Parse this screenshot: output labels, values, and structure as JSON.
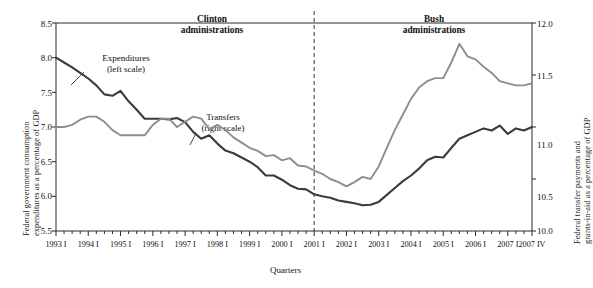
{
  "chart_data": {
    "type": "line",
    "title": "",
    "xlabel": "Quarters",
    "ylabel": "Federal government consumption expenditures as a percentage of GDP",
    "ylabel_right": "Federal transfer payments and grants-in-aid as a percentage of GDP",
    "ylim": [
      5.5,
      8.5
    ],
    "ylim_right": [
      10.0,
      12.0
    ],
    "yticks": [
      "8.5",
      "8.0",
      "7.5",
      "7.0",
      "6.5",
      "6.0",
      "5.5"
    ],
    "yticks_right": [
      "12.0",
      "11.5",
      "11.0",
      "10.5",
      "10.0"
    ],
    "xticks": [
      "1993 I",
      "1994 I",
      "1995 I",
      "1996 I",
      "1997 I",
      "1998 I",
      "1999 I",
      "2000 I",
      "2001 I",
      "2002 I",
      "2003 I",
      "2004 I",
      "2005 I",
      "2006 I",
      "2007 I",
      "2007 IV"
    ],
    "grid": false,
    "legend_position": "inline-annotation",
    "x_quarters_count": 60,
    "x_start": "1993 I",
    "x_end": "2007 IV",
    "series": [
      {
        "name": "Expenditures",
        "scale": "left",
        "color": "#3b3b3b",
        "values": [
          8.0,
          7.93,
          7.86,
          7.78,
          7.7,
          7.6,
          7.47,
          7.45,
          7.52,
          7.37,
          7.25,
          7.12,
          7.12,
          7.12,
          7.11,
          7.13,
          7.07,
          6.93,
          6.83,
          6.88,
          6.76,
          6.66,
          6.62,
          6.56,
          6.5,
          6.42,
          6.3,
          6.3,
          6.24,
          6.16,
          6.11,
          6.1,
          6.03,
          6.0,
          5.98,
          5.94,
          5.92,
          5.9,
          5.87,
          5.88,
          5.92,
          6.02,
          6.12,
          6.22,
          6.3,
          6.4,
          6.52,
          6.57,
          6.56,
          6.7,
          6.83,
          6.88,
          6.93,
          6.98,
          6.95,
          7.02,
          6.9,
          6.98,
          6.95,
          7.0
        ]
      },
      {
        "name": "Transfers",
        "scale": "right",
        "color": "#8d8d8d",
        "values": [
          11.0,
          11.0,
          11.02,
          11.07,
          11.1,
          11.1,
          11.05,
          10.97,
          10.92,
          10.92,
          10.92,
          10.92,
          11.02,
          11.08,
          11.08,
          11.0,
          11.05,
          11.1,
          11.08,
          10.98,
          11.02,
          10.97,
          10.9,
          10.85,
          10.8,
          10.77,
          10.72,
          10.73,
          10.68,
          10.7,
          10.63,
          10.62,
          10.58,
          10.55,
          10.5,
          10.47,
          10.43,
          10.47,
          10.52,
          10.5,
          10.62,
          10.8,
          10.97,
          11.12,
          11.27,
          11.38,
          11.44,
          11.47,
          11.47,
          11.62,
          11.8,
          11.68,
          11.65,
          11.58,
          11.52,
          11.44,
          11.42,
          11.4,
          11.4,
          11.42
        ]
      }
    ],
    "annotations": [
      {
        "id": "clinton",
        "line1": "Clinton",
        "line2": "administrations"
      },
      {
        "id": "bush",
        "line1": "Bush",
        "line2": "administrations"
      },
      {
        "id": "expenditures",
        "line1": "Expenditures",
        "line2": "(left scale)"
      },
      {
        "id": "transfers",
        "line1": "Transfers",
        "line2": "(right scale)"
      }
    ],
    "divider": {
      "label": "2001 I",
      "style": "dashed"
    }
  },
  "colors": {
    "expenditures": "#3b3b3b",
    "transfers": "#8d8d8d",
    "axis": "#2b2b2b",
    "background": "#ffffff"
  }
}
